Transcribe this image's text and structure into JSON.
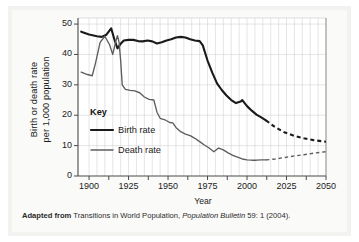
{
  "chart_data": {
    "type": "line",
    "title": "",
    "xlabel": "Year",
    "ylabel": "Birth or death rate per 1,000 population",
    "xlim": [
      1893,
      2050
    ],
    "ylim": [
      0,
      52
    ],
    "xticks": [
      1900,
      1925,
      1950,
      1975,
      2000,
      2025,
      2050
    ],
    "yticks": [
      0,
      10,
      20,
      30,
      40,
      50
    ],
    "grid": true,
    "legend_position": "inside-lower-left",
    "legend_title": "Key",
    "series": [
      {
        "name": "Birth rate",
        "color": "#1a1a1a",
        "width": 2.1,
        "solid": [
          [
            1895,
            47.5
          ],
          [
            1900,
            46.6
          ],
          [
            1905,
            46.0
          ],
          [
            1908,
            45.8
          ],
          [
            1911,
            46.5
          ],
          [
            1914,
            48.6
          ],
          [
            1916,
            45.0
          ],
          [
            1918,
            42.0
          ],
          [
            1920,
            43.5
          ],
          [
            1922,
            44.6
          ],
          [
            1925,
            44.8
          ],
          [
            1928,
            44.8
          ],
          [
            1931,
            44.4
          ],
          [
            1934,
            44.3
          ],
          [
            1937,
            44.6
          ],
          [
            1940,
            44.3
          ],
          [
            1943,
            43.6
          ],
          [
            1946,
            44.0
          ],
          [
            1949,
            44.6
          ],
          [
            1952,
            45.0
          ],
          [
            1955,
            45.6
          ],
          [
            1958,
            45.8
          ],
          [
            1961,
            45.6
          ],
          [
            1964,
            45.0
          ],
          [
            1967,
            44.6
          ],
          [
            1970,
            44.4
          ],
          [
            1972,
            43.0
          ],
          [
            1975,
            38.0
          ],
          [
            1978,
            34.0
          ],
          [
            1981,
            30.5
          ],
          [
            1984,
            28.3
          ],
          [
            1987,
            26.5
          ],
          [
            1990,
            25.0
          ],
          [
            1993,
            24.0
          ],
          [
            1996,
            24.5
          ],
          [
            1997,
            25.0
          ],
          [
            2000,
            23.0
          ],
          [
            2003,
            21.5
          ],
          [
            2006,
            20.2
          ],
          [
            2009,
            19.3
          ],
          [
            2012,
            18.3
          ]
        ],
        "dashed": [
          [
            2012,
            18.3
          ],
          [
            2018,
            16.0
          ],
          [
            2024,
            14.3
          ],
          [
            2030,
            13.2
          ],
          [
            2036,
            12.4
          ],
          [
            2042,
            11.8
          ],
          [
            2050,
            11.3
          ]
        ]
      },
      {
        "name": "Death rate",
        "color": "#5d5d5d",
        "width": 1.35,
        "solid": [
          [
            1895,
            34.2
          ],
          [
            1899,
            33.4
          ],
          [
            1902,
            33.0
          ],
          [
            1904,
            37.0
          ],
          [
            1907,
            44.0
          ],
          [
            1910,
            46.0
          ],
          [
            1913,
            43.2
          ],
          [
            1915,
            40.0
          ],
          [
            1917,
            44.5
          ],
          [
            1918,
            46.2
          ],
          [
            1919,
            44.0
          ],
          [
            1920,
            38.0
          ],
          [
            1921,
            30.0
          ],
          [
            1923,
            28.5
          ],
          [
            1926,
            28.2
          ],
          [
            1929,
            28.0
          ],
          [
            1932,
            27.4
          ],
          [
            1935,
            26.0
          ],
          [
            1938,
            25.2
          ],
          [
            1941,
            25.0
          ],
          [
            1943,
            21.0
          ],
          [
            1945,
            19.0
          ],
          [
            1948,
            18.5
          ],
          [
            1951,
            17.6
          ],
          [
            1953,
            17.5
          ],
          [
            1955,
            16.0
          ],
          [
            1958,
            14.6
          ],
          [
            1961,
            13.8
          ],
          [
            1964,
            13.3
          ],
          [
            1967,
            12.4
          ],
          [
            1970,
            11.3
          ],
          [
            1973,
            10.2
          ],
          [
            1976,
            9.2
          ],
          [
            1979,
            8.0
          ],
          [
            1982,
            9.2
          ],
          [
            1985,
            8.6
          ],
          [
            1988,
            7.6
          ],
          [
            1991,
            6.8
          ],
          [
            1994,
            6.2
          ],
          [
            1997,
            5.6
          ],
          [
            2000,
            5.3
          ],
          [
            2003,
            5.2
          ],
          [
            2006,
            5.2
          ],
          [
            2009,
            5.3
          ],
          [
            2012,
            5.3
          ]
        ],
        "dashed": [
          [
            2012,
            5.3
          ],
          [
            2018,
            5.6
          ],
          [
            2024,
            6.1
          ],
          [
            2030,
            6.6
          ],
          [
            2036,
            7.0
          ],
          [
            2042,
            7.5
          ],
          [
            2050,
            8.0
          ]
        ]
      }
    ]
  },
  "axes": {
    "y_title_line1": "Birth or death rate",
    "y_title_line2": "per 1,000 population",
    "x_title": "Year",
    "y_tick_labels": [
      "50",
      "40",
      "30",
      "20",
      "10",
      "0"
    ],
    "x_tick_labels": [
      "1900",
      "1925",
      "1950",
      "1975",
      "2000",
      "2025",
      "2050"
    ]
  },
  "legend": {
    "title": "Key",
    "items": [
      {
        "label": "Birth rate",
        "color": "#1a1a1a"
      },
      {
        "label": "Death rate",
        "color": "#5d5d5d"
      }
    ]
  },
  "caption": {
    "prefix": "Adapted from",
    "body_1": " Transitions in World Population, ",
    "italic": "Population Bulletin",
    "body_2": " 59: 1 (2004)."
  },
  "colors": {
    "birth": "#1a1a1a",
    "death": "#5d5d5d",
    "grid": "#d0d0cf",
    "axis": "#4a4a4a",
    "panel": "#f2f2f1",
    "inner": "#fafaf9"
  }
}
